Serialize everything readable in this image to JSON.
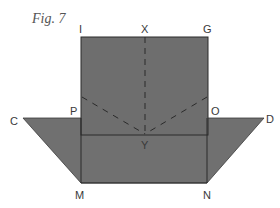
{
  "figure": {
    "caption": "Fig. 7",
    "fill_color": "#6f6f6f",
    "line_color": "#2a2a2a",
    "labels": {
      "I": "I",
      "X": "X",
      "G": "G",
      "C": "C",
      "P": "P",
      "O": "O",
      "D": "D",
      "Y": "Y",
      "M": "M",
      "N": "N"
    }
  }
}
